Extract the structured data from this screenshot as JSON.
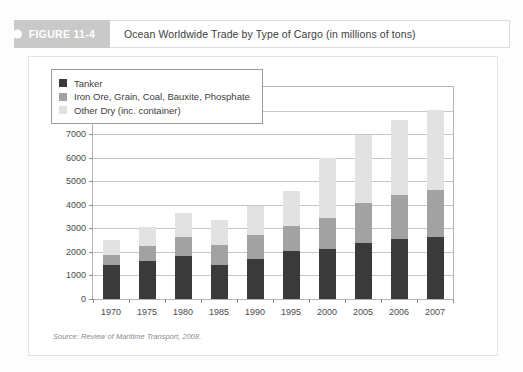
{
  "figure": {
    "badge_label": "FIGURE 11-4",
    "title": "Ocean Worldwide Trade by Type of Cargo (in millions of tons)",
    "source": "Source: Review of Maritime Transport, 2008."
  },
  "colors": {
    "tanker": "#3a3a3a",
    "iron_ore": "#a2a2a2",
    "other_dry": "#e2e2e2",
    "badge": "#c9c9c9",
    "grid": "#c6c6c6",
    "axis": "#b5b5b5"
  },
  "chart_data": {
    "type": "bar",
    "stacked": true,
    "title": "Ocean Worldwide Trade by Type of Cargo (in millions of tons)",
    "xlabel": "",
    "ylabel": "",
    "ylim": [
      0,
      9000
    ],
    "ytick_step": 1000,
    "yticks": [
      0,
      1000,
      2000,
      3000,
      4000,
      5000,
      6000,
      7000,
      8000,
      9000
    ],
    "grid": true,
    "legend_position": "top-left",
    "categories": [
      "1970",
      "1975",
      "1980",
      "1985",
      "1990",
      "1995",
      "2000",
      "2005",
      "2006",
      "2007"
    ],
    "series": [
      {
        "name": "Tanker",
        "color": "#3a3a3a",
        "values": [
          1440,
          1620,
          1840,
          1440,
          1710,
          2030,
          2140,
          2380,
          2550,
          2650
        ]
      },
      {
        "name": "Iron Ore, Grain, Coal, Bauxite, Phosphate",
        "color": "#a2a2a2",
        "values": [
          440,
          640,
          800,
          860,
          1000,
          1090,
          1280,
          1680,
          1870,
          1980
        ]
      },
      {
        "name": "Other Dry (inc. container)",
        "color": "#e2e2e2",
        "values": [
          620,
          780,
          1010,
          1050,
          1240,
          1460,
          2570,
          2910,
          3200,
          3390
        ]
      }
    ],
    "totals": [
      2500,
      3040,
      3650,
      3350,
      3950,
      4580,
      5990,
      6970,
      7620,
      8020
    ]
  }
}
